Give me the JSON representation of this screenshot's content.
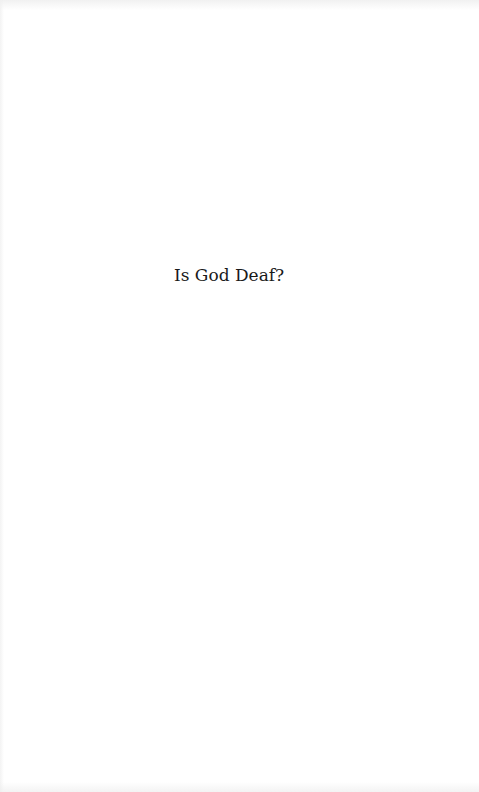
{
  "page": {
    "type": "half-title",
    "title": "Is God Deaf?"
  },
  "colors": {
    "background": "#ffffff",
    "text": "#1a1a1a"
  }
}
